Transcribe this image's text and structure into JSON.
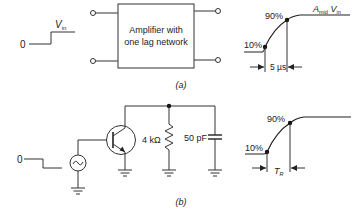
{
  "figure": {
    "part_a": {
      "caption": "(a)",
      "input": {
        "zero_label": "0",
        "step_label": "V",
        "step_sub": "in"
      },
      "block": {
        "line1": "Amplifier with",
        "line2": "one lag network"
      },
      "output": {
        "final_label_main": "A",
        "final_label_sub": "mid",
        "final_label_tail": " V",
        "final_label_tail_sub": "in",
        "pct_high": "90%",
        "pct_low": "10%",
        "rise_time": "5 µs"
      }
    },
    "part_b": {
      "caption": "(b)",
      "input": {
        "zero_label": "0"
      },
      "resistor": "4 kΩ",
      "capacitor": "50 pF",
      "output": {
        "pct_high": "90%",
        "pct_low": "10%",
        "rise_time_main": "T",
        "rise_time_sub": "R"
      }
    }
  }
}
